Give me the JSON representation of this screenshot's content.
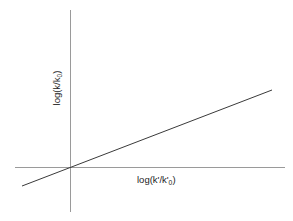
{
  "figure": {
    "background_color": "#ffffff",
    "width": 293,
    "height": 221
  },
  "axes": {
    "x_axis": {
      "label_text": "log(k'/k'",
      "label_subscript": "0",
      "label_suffix": ")",
      "color": "#9a9a9a",
      "x_start": 15,
      "x_end": 285,
      "y": 167
    },
    "y_axis": {
      "label_text": "log(k/k",
      "label_subscript": "0",
      "label_suffix": ")",
      "color": "#9a9a9a",
      "x": 70,
      "y_start": 10,
      "y_end": 212
    }
  },
  "chart_data": {
    "type": "line",
    "title": "",
    "xlabel": "log(k'/k'0)",
    "ylabel": "log(k/k0)",
    "grid": false,
    "legend": "none",
    "axis_style": "origin-crossing",
    "xlim": [
      -0.22,
      0.86
    ],
    "ylim": [
      -0.12,
      0.4
    ],
    "series": [
      {
        "name": "linear free energy relationship",
        "color": "#3a3a3a",
        "line_width": 1,
        "x": [
          -0.192,
          0.808
        ],
        "y": [
          -0.076,
          0.308
        ],
        "slope": 0.384,
        "intercept": 0.0,
        "pixel_points": [
          {
            "x": 22,
            "y": 186
          },
          {
            "x": 272,
            "y": 90
          }
        ]
      }
    ],
    "annotations": [],
    "tick_labels": {
      "x": [],
      "y": []
    }
  }
}
